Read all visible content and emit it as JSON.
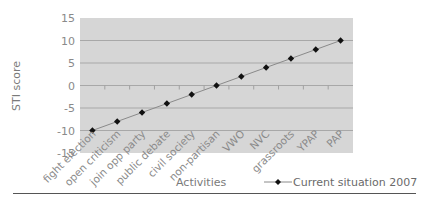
{
  "chart_data": {
    "type": "line",
    "title": "",
    "xlabel": "Activities",
    "ylabel": "STI score",
    "ylim": [
      -15,
      15
    ],
    "yticks": [
      15,
      10,
      5,
      0,
      -5,
      -10,
      -15
    ],
    "grid": true,
    "legend_position": "bottom-right",
    "categories": [
      "fight election",
      "open criticism",
      "join opp party",
      "public debate",
      "civil society",
      "non-partisan",
      "VWO",
      "NVC",
      "grassroots",
      "YPAP",
      "PAP"
    ],
    "series": [
      {
        "name": "Current situation 2007",
        "marker": "diamond",
        "values": [
          -10,
          -8,
          -6,
          -4,
          -2,
          0,
          2,
          4,
          6,
          8,
          10
        ]
      }
    ]
  },
  "colors": {
    "plot_background": "#d6d6d6",
    "gridline": "#a8a8a8",
    "series_line": "#8a8a8a",
    "marker": "#111111",
    "rule": "#555555"
  }
}
